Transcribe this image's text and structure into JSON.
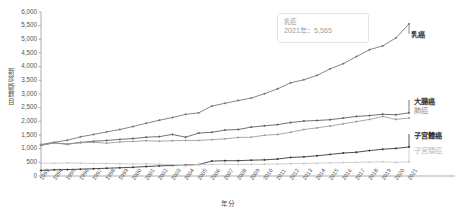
{
  "chart_data": {
    "type": "line",
    "title": "",
    "xlabel": "年分",
    "ylabel": "新診斷數目",
    "ylim": [
      0,
      6000
    ],
    "ytick_step": 500,
    "grid": false,
    "legend_position": "right-inline",
    "ytick_labels": [
      "0",
      "500",
      "1,000",
      "1,500",
      "2,000",
      "2,500",
      "3,000",
      "3,500",
      "4,000",
      "4,500",
      "5,000",
      "5,500",
      "6,000"
    ],
    "categories": [
      "1993",
      "1994",
      "1995",
      "1996",
      "1997",
      "1998",
      "1999",
      "2000",
      "2001",
      "2002",
      "2003",
      "2004",
      "2005",
      "2006",
      "2007",
      "2008",
      "2009",
      "2010",
      "2011",
      "2012",
      "2013",
      "2014",
      "2015",
      "2016",
      "2017",
      "2018",
      "2019",
      "2020",
      "2021"
    ],
    "series": [
      {
        "name": "乳癌",
        "color": "#6f6f6f",
        "values": [
          1152,
          1232,
          1310,
          1432,
          1520,
          1615,
          1700,
          1810,
          1930,
          2040,
          2140,
          2255,
          2310,
          2560,
          2660,
          2760,
          2850,
          3010,
          3190,
          3410,
          3520,
          3680,
          3920,
          4110,
          4370,
          4620,
          4760,
          5050,
          5565
        ]
      },
      {
        "name": "大腸癌",
        "color": "#5a5a5a",
        "values": [
          1120,
          1215,
          1165,
          1230,
          1270,
          1300,
          1340,
          1370,
          1420,
          1440,
          1520,
          1420,
          1570,
          1600,
          1680,
          1700,
          1790,
          1835,
          1880,
          1955,
          2010,
          2030,
          2060,
          2120,
          2180,
          2210,
          2260,
          2240,
          2310
        ]
      },
      {
        "name": "肺癌",
        "color": "#9a9a9a",
        "values": [
          1130,
          1205,
          1160,
          1215,
          1235,
          1200,
          1245,
          1265,
          1290,
          1275,
          1290,
          1300,
          1300,
          1330,
          1360,
          1410,
          1420,
          1490,
          1520,
          1600,
          1700,
          1760,
          1830,
          1910,
          1990,
          2070,
          2180,
          2070,
          2120
        ]
      },
      {
        "name": "子宮體癌",
        "color": "#2f2f2f",
        "values": [
          205,
          225,
          235,
          250,
          265,
          285,
          300,
          320,
          345,
          370,
          385,
          400,
          420,
          545,
          560,
          560,
          580,
          590,
          620,
          680,
          700,
          740,
          790,
          840,
          870,
          930,
          980,
          1010,
          1060
        ]
      },
      {
        "name": "子宮頸癌",
        "color": "#c8c8c8",
        "values": [
          470,
          465,
          480,
          470,
          455,
          460,
          450,
          440,
          445,
          430,
          415,
          370,
          430,
          420,
          430,
          420,
          425,
          430,
          440,
          450,
          460,
          470,
          480,
          490,
          500,
          510,
          520,
          500,
          520
        ]
      }
    ],
    "annotation": {
      "series": "乳癌",
      "year": "2021",
      "label_line1": "乳癌",
      "label_line2": "2021年：5,565",
      "value": 5565
    }
  }
}
